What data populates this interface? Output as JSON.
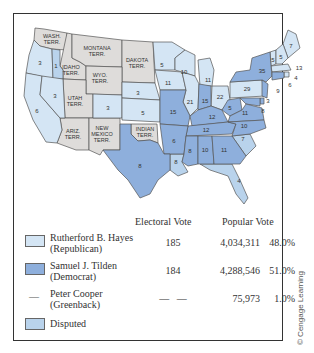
{
  "colors": {
    "hayes": "#d4e5f4",
    "tilden": "#8eafdc",
    "disputed": "#b9d3ec",
    "territory": "#dedcda",
    "border": "#555555"
  },
  "map": {
    "territories": [
      {
        "name": "WASH. TERR.",
        "line1": "WASH.",
        "line2": "TERR."
      },
      {
        "name": "MONTANA TERR.",
        "line1": "MONTANA",
        "line2": "TERR."
      },
      {
        "name": "DAKOTA TERR.",
        "line1": "DAKOTA",
        "line2": "TERR."
      },
      {
        "name": "IDAHO TERR.",
        "line1": "IDAHO",
        "line2": "TERR."
      },
      {
        "name": "WYO. TERR.",
        "line1": "WYO.",
        "line2": "TERR."
      },
      {
        "name": "UTAH TERR.",
        "line1": "UTAH",
        "line2": "TERR."
      },
      {
        "name": "ARIZ. TERR.",
        "line1": "ARIZ.",
        "line2": "TERR."
      },
      {
        "name": "NEW MEXICO TERR.",
        "line1": "NEW",
        "line2": "MEXICO",
        "line3": "TERR."
      },
      {
        "name": "INDIAN TERR.",
        "line1": "INDIAN",
        "line2": "TERR."
      }
    ],
    "state_votes": {
      "oregon": "3",
      "oregon_disputed_elector": "1",
      "california": "6",
      "nevada": "3",
      "colorado": "3",
      "nebraska": "3",
      "kansas": "5",
      "minnesota": "5",
      "iowa": "11",
      "wisconsin": "10",
      "michigan": "11",
      "illinois": "21",
      "indiana": "15",
      "ohio": "22",
      "pennsylvania": "29",
      "new_york": "35",
      "maine": "7",
      "nh": "5",
      "vt": "5",
      "massachusetts": "13",
      "ri": "4",
      "connecticut": "6",
      "new_jersey": "9",
      "delaware": "3",
      "maryland": "8",
      "west_virginia": "5",
      "virginia": "11",
      "missouri": "15",
      "kentucky": "12",
      "tennessee": "12",
      "north_carolina": "10",
      "south_carolina": "7",
      "arkansas": "6",
      "louisiana": "8",
      "mississippi": "8",
      "alabama": "10",
      "georgia": "11",
      "florida": "4",
      "texas": "8"
    }
  },
  "legend": {
    "headers": {
      "electoral": "Electoral Vote",
      "popular": "Popular Vote"
    },
    "rows": [
      {
        "line1": "Rutherford B. Hayes",
        "line2": "(Republican)",
        "electoral": "185",
        "popular": "4,034,311",
        "percent": "48.0%"
      },
      {
        "line1": "Samuel J. Tilden",
        "line2": "(Democrat)",
        "electoral": "184",
        "popular": "4,288,546",
        "percent": "51.0%"
      },
      {
        "line1": "Peter Cooper",
        "line2": "(Greenback)",
        "electoral": "—   —",
        "popular": "75,973",
        "percent": "1.0%",
        "swatch": "—"
      },
      {
        "line1": "Disputed"
      }
    ]
  },
  "credit": "© Cengage Learning"
}
